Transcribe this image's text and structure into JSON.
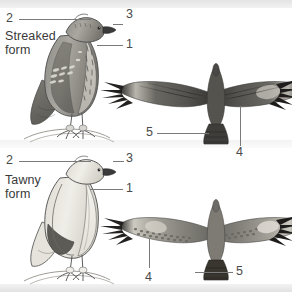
{
  "figure": {
    "type": "scientific-illustration-plate",
    "background_color": "#ffffff",
    "band_color": "#e9e9e9",
    "line_color": "#7a7a7a",
    "text_color": "#3a3a3a"
  },
  "panels": [
    {
      "id": "streaked",
      "form_label_line1": "Streaked",
      "form_label_line2": "form",
      "perched_caption": "perched streaked-form raptor, left profile on branch",
      "flight_caption": "flying streaked-form raptor seen from above, wings spread",
      "callouts": [
        {
          "number": "2",
          "target": "crown"
        },
        {
          "number": "3",
          "target": "bill"
        },
        {
          "number": "1",
          "target": "breast"
        },
        {
          "number": "5",
          "target": "tail"
        },
        {
          "number": "4",
          "target": "wing-panel"
        }
      ]
    },
    {
      "id": "tawny",
      "form_label_line1": "Tawny",
      "form_label_line2": "form",
      "perched_caption": "perched tawny-form raptor, left profile on branch",
      "flight_caption": "flying tawny-form raptor seen from above, wings spread",
      "callouts": [
        {
          "number": "2",
          "target": "crown"
        },
        {
          "number": "3",
          "target": "bill"
        },
        {
          "number": "1",
          "target": "breast"
        },
        {
          "number": "4",
          "target": "wing-panel"
        },
        {
          "number": "5",
          "target": "tail"
        }
      ]
    }
  ],
  "labels": {
    "streaked_num_2": "2",
    "streaked_num_3": "3",
    "streaked_num_1": "1",
    "streaked_num_5": "5",
    "streaked_num_4": "4",
    "tawny_num_2": "2",
    "tawny_num_3": "3",
    "tawny_num_1": "1",
    "tawny_num_4": "4",
    "tawny_num_5": "5"
  },
  "palette": {
    "dark_plumage": "#6f6f6f",
    "mid_plumage": "#9a9a9a",
    "light_plumage": "#d8d6d0",
    "pale_plumage": "#efece5",
    "outline": "#4b4b4b",
    "wing_dark": "#5c5c5c",
    "wing_tip": "#2b2b2b"
  }
}
